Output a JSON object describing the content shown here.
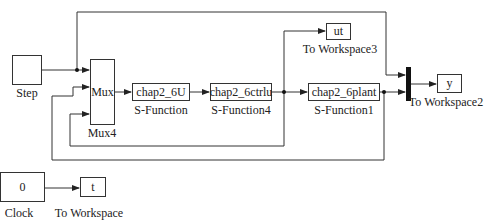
{
  "diagram": {
    "blocks": {
      "step": {
        "label": "Step"
      },
      "mux": {
        "text": "Mux",
        "label": "Mux4"
      },
      "sfun_u": {
        "text": "chap2_6U",
        "label": "S-Function"
      },
      "sfun_ctrl": {
        "text": "chap2_6ctrlu",
        "label": "S-Function4"
      },
      "sfun_plant": {
        "text": "chap2_6plant",
        "label": "S-Function1"
      },
      "ws_ut": {
        "text": "ut",
        "label": "To Workspace3"
      },
      "ws_y": {
        "text": "y",
        "label": "To Workspace2"
      },
      "clock": {
        "text": "0",
        "label": "Clock"
      },
      "ws_t": {
        "text": "t",
        "label": "To Workspace"
      }
    },
    "colors": {
      "line": "#333333",
      "bus": "#111111",
      "background": "#ffffff"
    }
  }
}
